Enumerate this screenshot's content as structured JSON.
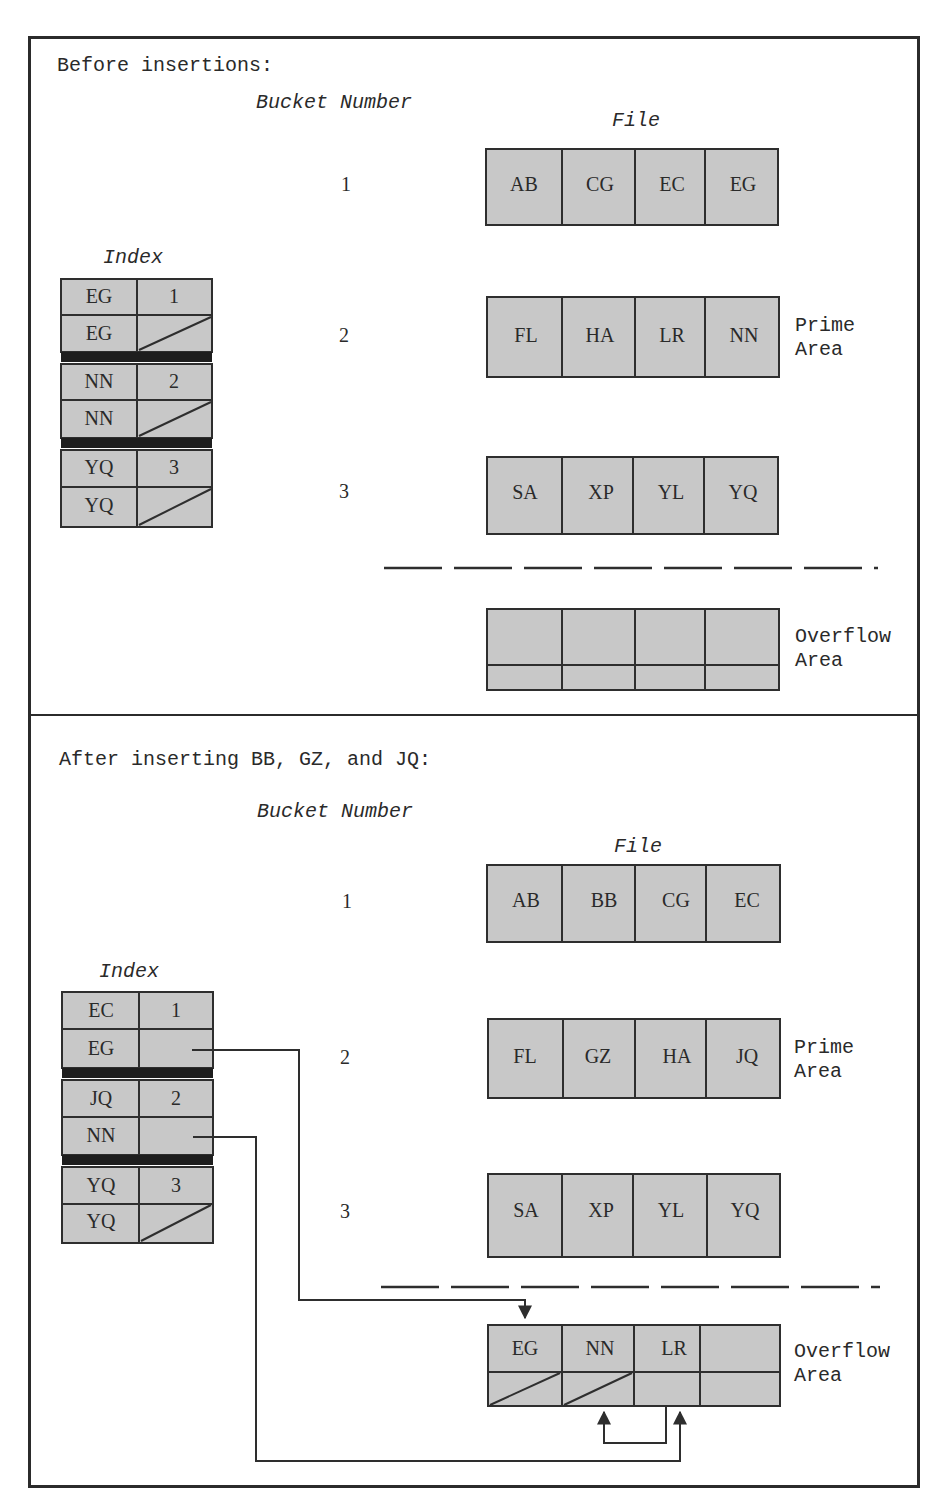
{
  "before": {
    "heading": "Before insertions:",
    "bucket_number_label": "Bucket Number",
    "file_label": "File",
    "index_label": "Index",
    "bucket_numbers": [
      "1",
      "2",
      "3"
    ],
    "index_rows": [
      {
        "key": "EG",
        "ptr": "1"
      },
      {
        "key": "EG",
        "ptr": "null"
      },
      {
        "key": "NN",
        "ptr": "2"
      },
      {
        "key": "NN",
        "ptr": "null"
      },
      {
        "key": "YQ",
        "ptr": "3"
      },
      {
        "key": "YQ",
        "ptr": "null"
      }
    ],
    "prime_buckets": [
      [
        "AB",
        "CG",
        "EC",
        "EG"
      ],
      [
        "FL",
        "HA",
        "LR",
        "NN"
      ],
      [
        "SA",
        "XP",
        "YL",
        "YQ"
      ]
    ],
    "overflow_records": [
      "",
      "",
      "",
      ""
    ],
    "prime_area_label": [
      "Prime",
      "Area"
    ],
    "overflow_area_label": [
      "Overflow",
      "Area"
    ]
  },
  "after": {
    "heading": "After inserting BB, GZ, and JQ:",
    "bucket_number_label": "Bucket Number",
    "file_label": "File",
    "index_label": "Index",
    "bucket_numbers": [
      "1",
      "2",
      "3"
    ],
    "index_rows": [
      {
        "key": "EC",
        "ptr": "1"
      },
      {
        "key": "EG",
        "ptr": "→ overflow EG"
      },
      {
        "key": "JQ",
        "ptr": "2"
      },
      {
        "key": "NN",
        "ptr": "→ overflow LR"
      },
      {
        "key": "YQ",
        "ptr": "3"
      },
      {
        "key": "YQ",
        "ptr": "null"
      }
    ],
    "prime_buckets": [
      [
        "AB",
        "BB",
        "CG",
        "EC"
      ],
      [
        "FL",
        "GZ",
        "HA",
        "JQ"
      ],
      [
        "SA",
        "XP",
        "YL",
        "YQ"
      ]
    ],
    "overflow_records": [
      {
        "key": "EG",
        "next": "null"
      },
      {
        "key": "NN",
        "next": "null"
      },
      {
        "key": "LR",
        "next": "NN"
      },
      {
        "key": "",
        "next": ""
      }
    ],
    "prime_area_label": [
      "Prime",
      "Area"
    ],
    "overflow_area_label": [
      "Overflow",
      "Area"
    ]
  },
  "colors": {
    "cell_fill": "#c8c8c8",
    "stroke": "#2e2e2e",
    "separator": "#1e1e1e"
  }
}
